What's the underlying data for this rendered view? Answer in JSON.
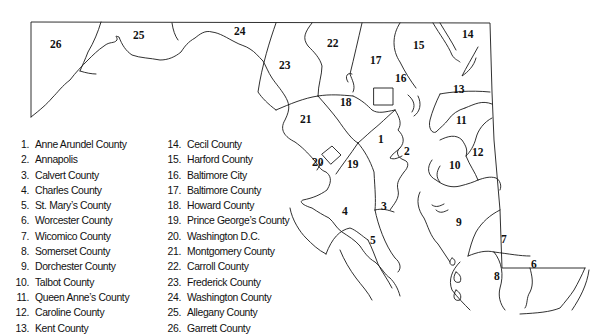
{
  "map": {
    "title": "Maryland counties",
    "region_labels": [
      {
        "id": "1",
        "x": 378,
        "y": 143
      },
      {
        "id": "2",
        "x": 404,
        "y": 155
      },
      {
        "id": "3",
        "x": 381,
        "y": 210
      },
      {
        "id": "4",
        "x": 342,
        "y": 215
      },
      {
        "id": "5",
        "x": 370,
        "y": 244
      },
      {
        "id": "6",
        "x": 531,
        "y": 268
      },
      {
        "id": "7",
        "x": 501,
        "y": 243
      },
      {
        "id": "8",
        "x": 494,
        "y": 280
      },
      {
        "id": "9",
        "x": 456,
        "y": 226
      },
      {
        "id": "10",
        "x": 449,
        "y": 169
      },
      {
        "id": "11",
        "x": 456,
        "y": 124
      },
      {
        "id": "12",
        "x": 472,
        "y": 156
      },
      {
        "id": "13",
        "x": 453,
        "y": 93
      },
      {
        "id": "14",
        "x": 462,
        "y": 38
      },
      {
        "id": "15",
        "x": 413,
        "y": 49
      },
      {
        "id": "16",
        "x": 395,
        "y": 82
      },
      {
        "id": "17",
        "x": 370,
        "y": 64
      },
      {
        "id": "18",
        "x": 340,
        "y": 106
      },
      {
        "id": "19",
        "x": 347,
        "y": 168
      },
      {
        "id": "20",
        "x": 312,
        "y": 166
      },
      {
        "id": "21",
        "x": 300,
        "y": 123
      },
      {
        "id": "22",
        "x": 327,
        "y": 47
      },
      {
        "id": "23",
        "x": 279,
        "y": 69
      },
      {
        "id": "24",
        "x": 234,
        "y": 35
      },
      {
        "id": "25",
        "x": 133,
        "y": 39
      },
      {
        "id": "26",
        "x": 50,
        "y": 48
      }
    ]
  },
  "legend": {
    "column_1": [
      {
        "num": "1.",
        "name": "Anne Arundel County"
      },
      {
        "num": "2.",
        "name": "Annapolis"
      },
      {
        "num": "3.",
        "name": "Calvert County"
      },
      {
        "num": "4.",
        "name": "Charles County"
      },
      {
        "num": "5.",
        "name": "St. Mary’s County"
      },
      {
        "num": "6.",
        "name": "Worcester County"
      },
      {
        "num": "7.",
        "name": "Wicomico County"
      },
      {
        "num": "8.",
        "name": "Somerset County"
      },
      {
        "num": "9.",
        "name": "Dorchester County"
      },
      {
        "num": "10.",
        "name": "Talbot County"
      },
      {
        "num": "11.",
        "name": "Queen Anne’s County"
      },
      {
        "num": "12.",
        "name": "Caroline County"
      },
      {
        "num": "13.",
        "name": "Kent County"
      }
    ],
    "column_2": [
      {
        "num": "14.",
        "name": "Cecil County"
      },
      {
        "num": "15.",
        "name": "Harford County"
      },
      {
        "num": "16.",
        "name": "Baltimore City"
      },
      {
        "num": "17.",
        "name": "Baltimore County"
      },
      {
        "num": "18.",
        "name": "Howard County"
      },
      {
        "num": "19.",
        "name": "Prince George’s County"
      },
      {
        "num": "20.",
        "name": "Washington D.C."
      },
      {
        "num": "21.",
        "name": "Montgomery County"
      },
      {
        "num": "22.",
        "name": "Carroll County"
      },
      {
        "num": "23.",
        "name": "Frederick County"
      },
      {
        "num": "24.",
        "name": "Washington County"
      },
      {
        "num": "25.",
        "name": "Allegany County"
      },
      {
        "num": "26.",
        "name": "Garrett County"
      }
    ]
  },
  "icons": {
    "capital_markers": [
      "star-icon Annapolis",
      "star-icon Washington D.C.",
      "star-icon Baltimore City"
    ]
  }
}
